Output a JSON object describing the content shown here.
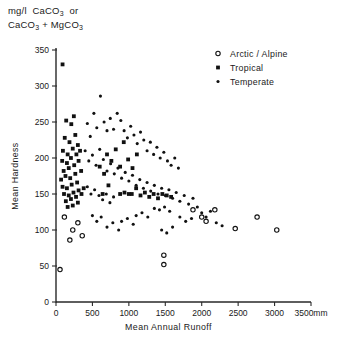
{
  "figure": {
    "y_axis_caption_line1": "mg/l  CaCO3  or",
    "y_axis_caption_line2": "CaCO3 + MgCO3",
    "y_axis_title": "Mean  Hardness",
    "x_axis_title": "Mean   Annual   Runoff",
    "x_unit_suffix": "mm"
  },
  "legend": {
    "position": "top-right",
    "entries": [
      {
        "label": "Arctic / Alpine",
        "marker": "open-circle",
        "key": "arctic"
      },
      {
        "label": "Tropical",
        "marker": "filled-square",
        "key": "tropical"
      },
      {
        "label": "Temperate",
        "marker": "filled-dot",
        "key": "temperate"
      }
    ]
  },
  "chart_data": {
    "type": "scatter",
    "xlabel": "Mean Annual Runoff",
    "ylabel": "Mean Hardness",
    "xlim": [
      0,
      3500
    ],
    "ylim": [
      0,
      350
    ],
    "xticks": [
      0,
      500,
      1000,
      1500,
      2000,
      2500,
      3000,
      3500
    ],
    "yticks": [
      0,
      50,
      100,
      150,
      200,
      250,
      300,
      350
    ],
    "xticklabels": [
      "0",
      "500",
      "1000",
      "1500",
      "2000",
      "2500",
      "3000",
      "3500"
    ],
    "yticklabels": [
      "0",
      "50",
      "100",
      "150",
      "200",
      "250",
      "300",
      "350"
    ],
    "grid": false,
    "series": [
      {
        "name": "Tropical",
        "marker": "filled-square",
        "color": "#111111",
        "points": [
          [
            90,
            330
          ],
          [
            140,
            252
          ],
          [
            210,
            247
          ],
          [
            245,
            258
          ],
          [
            120,
            228
          ],
          [
            185,
            222
          ],
          [
            265,
            232
          ],
          [
            95,
            210
          ],
          [
            160,
            205
          ],
          [
            230,
            213
          ],
          [
            300,
            218
          ],
          [
            85,
            196
          ],
          [
            150,
            193
          ],
          [
            205,
            200
          ],
          [
            280,
            205
          ],
          [
            330,
            210
          ],
          [
            105,
            182
          ],
          [
            175,
            186
          ],
          [
            250,
            190
          ],
          [
            310,
            196
          ],
          [
            70,
            170
          ],
          [
            130,
            175
          ],
          [
            195,
            172
          ],
          [
            265,
            178
          ],
          [
            345,
            182
          ],
          [
            90,
            160
          ],
          [
            150,
            158
          ],
          [
            215,
            163
          ],
          [
            290,
            166
          ],
          [
            110,
            150
          ],
          [
            175,
            148
          ],
          [
            240,
            152
          ],
          [
            310,
            155
          ],
          [
            380,
            158
          ],
          [
            135,
            140
          ],
          [
            205,
            143
          ],
          [
            275,
            146
          ],
          [
            350,
            150
          ],
          [
            160,
            132
          ],
          [
            230,
            134
          ],
          [
            300,
            138
          ],
          [
            700,
            205
          ],
          [
            760,
            196
          ],
          [
            820,
            212
          ],
          [
            880,
            188
          ],
          [
            930,
            222
          ],
          [
            990,
            198
          ],
          [
            1050,
            186
          ],
          [
            1110,
            205
          ],
          [
            1040,
            150
          ],
          [
            1100,
            158
          ],
          [
            1160,
            148
          ],
          [
            1220,
            152
          ],
          [
            1280,
            146
          ],
          [
            1340,
            150
          ],
          [
            1400,
            144
          ],
          [
            880,
            150
          ],
          [
            940,
            152
          ],
          [
            1000,
            150
          ],
          [
            1460,
            150
          ],
          [
            1520,
            148
          ],
          [
            1580,
            146
          ],
          [
            600,
            188
          ],
          [
            660,
            178
          ],
          [
            720,
            162
          ],
          [
            640,
            150
          ]
        ]
      },
      {
        "name": "Temperate",
        "marker": "filled-dot",
        "color": "#111111",
        "points": [
          [
            430,
            248
          ],
          [
            470,
            230
          ],
          [
            520,
            262
          ],
          [
            560,
            242
          ],
          [
            610,
            286
          ],
          [
            660,
            250
          ],
          [
            700,
            238
          ],
          [
            745,
            255
          ],
          [
            790,
            240
          ],
          [
            840,
            262
          ],
          [
            890,
            252
          ],
          [
            935,
            238
          ],
          [
            980,
            228
          ],
          [
            1025,
            244
          ],
          [
            1070,
            232
          ],
          [
            1115,
            220
          ],
          [
            1160,
            236
          ],
          [
            1205,
            225
          ],
          [
            1250,
            210
          ],
          [
            1295,
            222
          ],
          [
            1340,
            205
          ],
          [
            1385,
            215
          ],
          [
            1430,
            200
          ],
          [
            1480,
            208
          ],
          [
            1530,
            196
          ],
          [
            1580,
            190
          ],
          [
            1630,
            200
          ],
          [
            1680,
            186
          ],
          [
            400,
            210
          ],
          [
            450,
            196
          ],
          [
            500,
            204
          ],
          [
            550,
            190
          ],
          [
            600,
            212
          ],
          [
            650,
            198
          ],
          [
            700,
            182
          ],
          [
            750,
            192
          ],
          [
            800,
            178
          ],
          [
            850,
            186
          ],
          [
            900,
            172
          ],
          [
            950,
            180
          ],
          [
            1000,
            168
          ],
          [
            1050,
            176
          ],
          [
            1100,
            162
          ],
          [
            1150,
            170
          ],
          [
            1200,
            158
          ],
          [
            1250,
            166
          ],
          [
            1300,
            154
          ],
          [
            1350,
            162
          ],
          [
            1400,
            150
          ],
          [
            1450,
            158
          ],
          [
            1500,
            148
          ],
          [
            1550,
            156
          ],
          [
            1600,
            144
          ],
          [
            1650,
            152
          ],
          [
            1700,
            140
          ],
          [
            1760,
            148
          ],
          [
            1820,
            136
          ],
          [
            1880,
            144
          ],
          [
            1940,
            132
          ],
          [
            430,
            160
          ],
          [
            480,
            150
          ],
          [
            530,
            156
          ],
          [
            590,
            148
          ],
          [
            640,
            142
          ],
          [
            690,
            150
          ],
          [
            740,
            138
          ],
          [
            790,
            146
          ],
          [
            1350,
            130
          ],
          [
            1420,
            128
          ],
          [
            1490,
            132
          ],
          [
            1560,
            126
          ],
          [
            1100,
            120
          ],
          [
            1180,
            124
          ],
          [
            1260,
            118
          ],
          [
            900,
            112
          ],
          [
            980,
            116
          ],
          [
            1060,
            108
          ],
          [
            700,
            104
          ],
          [
            780,
            110
          ],
          [
            860,
            100
          ],
          [
            1700,
            118
          ],
          [
            1780,
            112
          ],
          [
            1860,
            116
          ],
          [
            2000,
            124
          ],
          [
            2060,
            118
          ],
          [
            2120,
            126
          ],
          [
            500,
            120
          ],
          [
            560,
            112
          ],
          [
            620,
            118
          ],
          [
            1450,
            100
          ],
          [
            1520,
            96
          ],
          [
            1600,
            104
          ],
          [
            2200,
            110
          ],
          [
            2280,
            106
          ]
        ]
      },
      {
        "name": "Arctic / Alpine",
        "marker": "open-circle",
        "color": "#111111",
        "points": [
          [
            55,
            45
          ],
          [
            115,
            118
          ],
          [
            230,
            100
          ],
          [
            300,
            110
          ],
          [
            360,
            92
          ],
          [
            190,
            86
          ],
          [
            1480,
            65
          ],
          [
            1480,
            52
          ],
          [
            2000,
            118
          ],
          [
            2060,
            112
          ],
          [
            2460,
            102
          ],
          [
            2760,
            118
          ],
          [
            3030,
            100
          ],
          [
            2180,
            128
          ],
          [
            1880,
            128
          ]
        ]
      }
    ]
  }
}
